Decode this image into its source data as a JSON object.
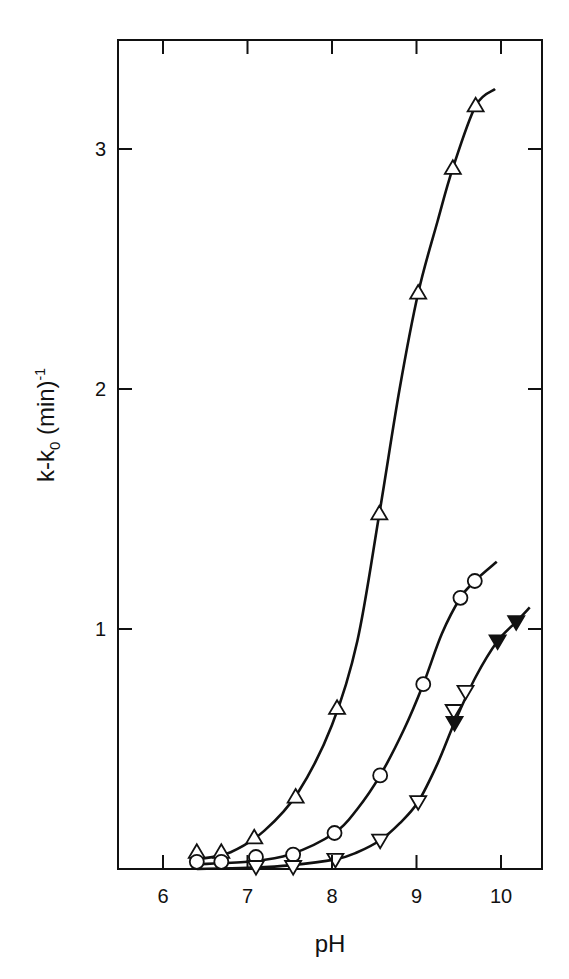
{
  "chart_data": {
    "type": "scatter",
    "title": "",
    "xlabel": "pH",
    "ylabel": "k-k0 (min)-1",
    "ylabel_parts": {
      "main": "k-k",
      "sub": "0",
      "unit": " (min)",
      "sup": "-1"
    },
    "xlim": [
      5.47,
      10.49
    ],
    "ylim": [
      0,
      3.4
    ],
    "xticks": [
      6,
      7,
      8,
      9,
      10
    ],
    "yticks": [
      1,
      2,
      3
    ],
    "grid": false,
    "legend": null,
    "series": [
      {
        "name": "open-up-triangle",
        "marker": "triangle-up-open",
        "x": [
          6.4,
          6.69,
          7.08,
          7.57,
          8.06,
          8.56,
          9.02,
          9.43,
          9.7
        ],
        "y": [
          0.07,
          0.07,
          0.13,
          0.3,
          0.67,
          1.48,
          2.4,
          2.92,
          3.18
        ],
        "curve": [
          [
            6.4,
            0.04
          ],
          [
            6.8,
            0.07
          ],
          [
            7.2,
            0.16
          ],
          [
            7.6,
            0.32
          ],
          [
            8.0,
            0.6
          ],
          [
            8.3,
            0.95
          ],
          [
            8.56,
            1.48
          ],
          [
            8.8,
            2.0
          ],
          [
            9.02,
            2.4
          ],
          [
            9.25,
            2.7
          ],
          [
            9.43,
            2.92
          ],
          [
            9.7,
            3.18
          ],
          [
            9.93,
            3.25
          ]
        ]
      },
      {
        "name": "open-circle",
        "marker": "circle-open",
        "x": [
          6.4,
          6.69,
          7.1,
          7.54,
          8.03,
          8.57,
          9.08,
          9.52,
          9.69
        ],
        "y": [
          0.03,
          0.03,
          0.05,
          0.06,
          0.15,
          0.39,
          0.77,
          1.13,
          1.2
        ],
        "curve": [
          [
            6.4,
            0.02
          ],
          [
            7.0,
            0.03
          ],
          [
            7.5,
            0.06
          ],
          [
            8.03,
            0.15
          ],
          [
            8.3,
            0.25
          ],
          [
            8.57,
            0.39
          ],
          [
            8.85,
            0.58
          ],
          [
            9.08,
            0.77
          ],
          [
            9.3,
            0.98
          ],
          [
            9.52,
            1.13
          ],
          [
            9.69,
            1.2
          ],
          [
            9.95,
            1.28
          ]
        ]
      },
      {
        "name": "open-down-triangle",
        "marker": "triangle-down-open",
        "x": [
          7.1,
          7.54,
          8.04,
          8.57,
          9.02,
          9.44,
          9.58
        ],
        "y": [
          0.01,
          0.01,
          0.04,
          0.12,
          0.28,
          0.66,
          0.74
        ]
      },
      {
        "name": "filled-down-triangle",
        "marker": "triangle-down-filled",
        "x": [
          9.45,
          9.96,
          10.18
        ],
        "y": [
          0.61,
          0.95,
          1.03
        ],
        "curve": [
          [
            6.4,
            0.0
          ],
          [
            7.0,
            0.005
          ],
          [
            7.5,
            0.015
          ],
          [
            8.04,
            0.04
          ],
          [
            8.3,
            0.07
          ],
          [
            8.57,
            0.12
          ],
          [
            8.8,
            0.19
          ],
          [
            9.02,
            0.28
          ],
          [
            9.25,
            0.44
          ],
          [
            9.45,
            0.61
          ],
          [
            9.7,
            0.8
          ],
          [
            9.96,
            0.95
          ],
          [
            10.18,
            1.03
          ],
          [
            10.34,
            1.09
          ]
        ]
      }
    ]
  },
  "axes": {
    "x_tick_labels": [
      "6",
      "7",
      "8",
      "9",
      "10"
    ],
    "y_tick_labels": [
      "1",
      "2",
      "3"
    ],
    "xlabel": "pH",
    "ylabel_main": "k-k",
    "ylabel_sub": "0",
    "ylabel_unit": " (min)",
    "ylabel_sup": "-1"
  },
  "colors": {
    "ink": "#111111",
    "background": "#ffffff"
  }
}
